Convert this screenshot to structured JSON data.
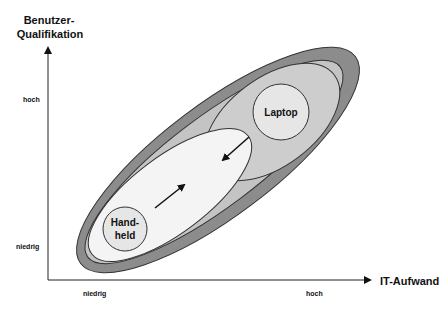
{
  "diagram": {
    "y_axis": {
      "title_line1": "Benutzer-",
      "title_line2": "Qualifikation",
      "tick_high": "hoch",
      "tick_low": "niedrig"
    },
    "x_axis": {
      "title": "IT-Aufwand",
      "tick_low": "niedrig",
      "tick_high": "hoch"
    },
    "nodes": {
      "laptop": {
        "label": "Laptop"
      },
      "handheld": {
        "label_line1": "Hand-",
        "label_line2": "held"
      }
    },
    "colors": {
      "outer_ellipse": "#8c8c8c",
      "middle_ellipse": "#c4c4c4",
      "laptop_region": "#cdcdcd",
      "handheld_region": "#f4f4f4",
      "circle_fill": "#e6e6e6",
      "stroke": "#333333"
    }
  }
}
